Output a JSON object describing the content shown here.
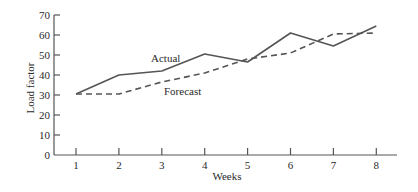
{
  "chart_data": {
    "type": "line",
    "title": "",
    "xlabel": "Weeks",
    "ylabel": "Load factor",
    "x": [
      1,
      2,
      3,
      4,
      5,
      6,
      7,
      8
    ],
    "x_ticks": [
      "1",
      "2",
      "3",
      "4",
      "5",
      "6",
      "7",
      "8"
    ],
    "y_ticks": [
      "0",
      "10",
      "20",
      "30",
      "40",
      "50",
      "60",
      "70"
    ],
    "ylim": [
      0,
      70
    ],
    "xlim": [
      0.5,
      8.5
    ],
    "grid": false,
    "legend": "inline labels",
    "series": [
      {
        "name": "Actual",
        "style": "solid",
        "color": "#555555",
        "values": [
          30.5,
          40,
          42,
          50.5,
          46.5,
          61,
          54.5,
          64.5
        ]
      },
      {
        "name": "Forecast",
        "style": "dashed",
        "color": "#555555",
        "values": [
          30.5,
          30.5,
          36.5,
          41,
          48,
          51,
          60.5,
          61
        ]
      }
    ],
    "annotations": [
      {
        "text": "Actual",
        "near_week": 3.3
      },
      {
        "text": "Forecast",
        "near_week": 3.6
      }
    ]
  }
}
